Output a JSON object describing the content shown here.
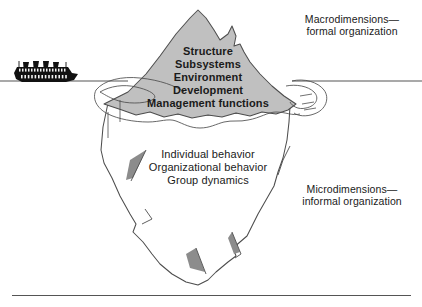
{
  "figure": {
    "background_color": "#ffffff",
    "waterline_color": "#555555",
    "outline_color": "#4d4d4d",
    "iceberg_above_fill": "#c0c0c0",
    "iceberg_below_fill": "#ffffff",
    "shading_fill": "#8c8c8c",
    "ship_color": "#111111",
    "text_color": "#1a1a1a"
  },
  "labels": {
    "macro": {
      "line1": "Macrodimensions—",
      "line2": "formal organization"
    },
    "micro": {
      "line1": "Microdimensions—",
      "line2": "informal organization"
    }
  },
  "above_water_items": [
    "Structure",
    "Subsystems",
    "Environment",
    "Development",
    "Management functions"
  ],
  "below_water_items": [
    "Individual behavior",
    "Organizational behavior",
    "Group dynamics"
  ],
  "icons": {
    "ship": "ocean-liner-icon",
    "waterline": "waterline",
    "iceberg_top": "iceberg-above-water",
    "iceberg_bottom": "iceberg-below-water"
  }
}
